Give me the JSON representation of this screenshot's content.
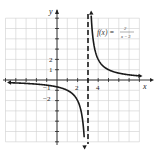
{
  "chart_data": {
    "type": "line",
    "title": "",
    "function_label": "f(x) = 2/(x − 3)",
    "function_parts": {
      "lhs": "f(x) =",
      "numerator": "2",
      "denominator": "x − 3"
    },
    "xlabel": "x",
    "ylabel": "y",
    "xlim": [
      -5,
      8
    ],
    "ylim": [
      -6,
      6
    ],
    "grid": true,
    "x_tick_labels": [
      {
        "value": 2,
        "label": "2"
      },
      {
        "value": 4,
        "label": "4"
      }
    ],
    "y_tick_labels": [
      {
        "value": 2,
        "label": "2"
      },
      {
        "value": 1,
        "label": "1"
      },
      {
        "value": -1,
        "label": "−1"
      },
      {
        "value": -2,
        "label": "−2"
      }
    ],
    "vertical_asymptote": {
      "x": 3,
      "style": "dashed"
    },
    "horizontal_asymptote": {
      "y": 0
    },
    "series": [
      {
        "name": "left branch",
        "x": [
          -4.5,
          -3,
          -2,
          -1,
          0,
          1,
          2,
          2.5,
          2.7
        ],
        "y": [
          -0.27,
          -0.33,
          -0.4,
          -0.5,
          -0.67,
          -1,
          -2,
          -4,
          -6.67
        ]
      },
      {
        "name": "right branch",
        "x": [
          3.33,
          3.5,
          4,
          5,
          6,
          7,
          8
        ],
        "y": [
          6,
          4,
          2,
          1,
          0.67,
          0.5,
          0.4
        ]
      }
    ]
  }
}
